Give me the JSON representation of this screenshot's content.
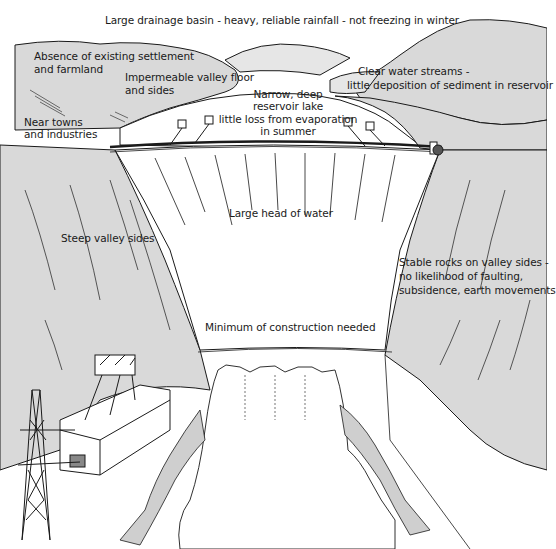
{
  "diagram": {
    "colors": {
      "ink": "#1a1a1a",
      "valley_fill": "#d9d9d9",
      "background": "#ffffff",
      "riverbed_fill": "#cfcfcf"
    },
    "labels": {
      "drainage_basin": "Large drainage basin - heavy, reliable rainfall - not freezing in winter",
      "settlement_line1": "Absence of existing settlement",
      "settlement_line2": "and farmland",
      "impermeable_line1": "Impermeable valley floor",
      "impermeable_line2": "and sides",
      "narrow_line1": "Narrow, deep",
      "narrow_line2": "reservoir lake",
      "evaporation_line1": "little loss from evaporation",
      "evaporation_line2": "in summer",
      "clear_streams_line1": "Clear water streams -",
      "clear_streams_line2": "little deposition of sediment in reservoir",
      "near_towns_line1": "Near towns",
      "near_towns_line2": "and industries",
      "head_of_water": "Large head of water",
      "steep_sides": "Steep valley sides",
      "stable_rocks_line1": "Stable rocks on valley sides -",
      "stable_rocks_line2": "no likelihood of faulting,",
      "stable_rocks_line3": "subsidence, earth movements",
      "construction": "Minimum of construction needed"
    },
    "features": [
      "drainage-basin-hills",
      "reservoir-lake",
      "arch-dam-wall",
      "dam-top-road",
      "intake-towers",
      "left-valley-side",
      "right-valley-side",
      "spillway-outflow",
      "power-station",
      "electricity-pylon",
      "river-bed"
    ]
  }
}
